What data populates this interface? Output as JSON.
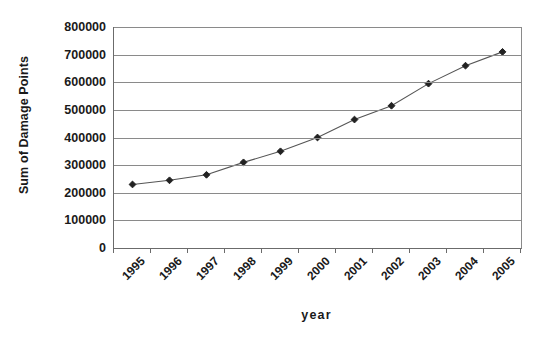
{
  "chart_data": {
    "type": "line",
    "title": "",
    "subtitle": "",
    "xlabel": "year",
    "ylabel": "Sum of Damage Points",
    "categories": [
      "1995",
      "1996",
      "1997",
      "1998",
      "1999",
      "2000",
      "2001",
      "2002",
      "2003",
      "2004",
      "2005"
    ],
    "x": [
      1995,
      1996,
      1997,
      1998,
      1999,
      2000,
      2001,
      2002,
      2003,
      2004,
      2005
    ],
    "values": [
      230000,
      245000,
      265000,
      310000,
      350000,
      400000,
      465000,
      515000,
      595000,
      660000,
      710000
    ],
    "series": [
      {
        "name": "Sum of Damage Points",
        "values": [
          230000,
          245000,
          265000,
          310000,
          350000,
          400000,
          465000,
          515000,
          595000,
          660000,
          710000
        ]
      }
    ],
    "ylim": [
      0,
      800000
    ],
    "ytick_labels": [
      "800000",
      "700000",
      "600000",
      "500000",
      "400000",
      "300000",
      "200000",
      "100000",
      "0"
    ],
    "yticks": [
      800000,
      700000,
      600000,
      500000,
      400000,
      300000,
      200000,
      100000,
      0
    ],
    "grid": "horizontal",
    "legend": "none",
    "marker": "diamond",
    "line_color": "#555555",
    "marker_color": "#222222",
    "grid_color": "#8a8a8a",
    "axis_color": "#6b6b6b",
    "background_color": "#ffffff"
  }
}
